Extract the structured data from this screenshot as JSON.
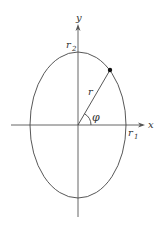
{
  "diagram": {
    "title": "",
    "labels": {
      "x_axis": "x",
      "y_axis": "y",
      "r1": "r",
      "r1_sub": "1",
      "r2": "r",
      "r2_sub": "2",
      "radius": "r",
      "angle": "φ"
    },
    "elements": [
      {
        "type": "ellipse",
        "label": "ellipse",
        "semi_axis_x": "r1",
        "semi_axis_y": "r2"
      },
      {
        "type": "axis",
        "label": "x"
      },
      {
        "type": "axis",
        "label": "y"
      },
      {
        "type": "segment",
        "label": "r",
        "from": "origin",
        "to": "point on ellipse"
      },
      {
        "type": "point",
        "label": "point on ellipse"
      },
      {
        "type": "arc",
        "label": "φ",
        "between": [
          "x-axis",
          "r"
        ]
      }
    ],
    "colors": {
      "stroke": "#444444",
      "text": "#333333",
      "background": "#ffffff"
    }
  }
}
